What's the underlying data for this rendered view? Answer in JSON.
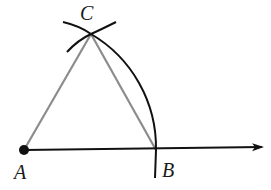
{
  "diagram": {
    "points": {
      "A": {
        "label": "A",
        "x": 24,
        "y": 150
      },
      "B": {
        "label": "B",
        "x": 156,
        "y": 150
      },
      "C": {
        "label": "C",
        "x": 91,
        "y": 34
      }
    },
    "labels": {
      "A": "A",
      "B": "B",
      "C": "C"
    },
    "colors": {
      "ray": "#111111",
      "arc": "#111111",
      "triangle_sides": "#8c8c8c"
    }
  }
}
